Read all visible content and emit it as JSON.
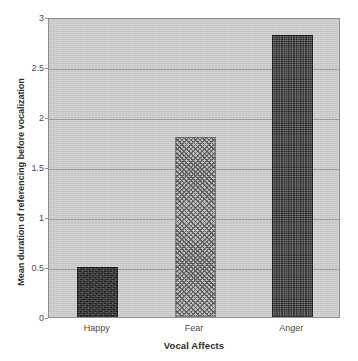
{
  "chart_data": {
    "type": "bar",
    "title": "",
    "categories": [
      "Happy",
      "Fear",
      "Anger"
    ],
    "values": [
      0.5,
      1.8,
      2.82
    ],
    "series": [
      {
        "name": "Mean duration of referencing before vocalization",
        "values": [
          0.5,
          1.8,
          2.82
        ]
      }
    ],
    "xlabel": "Vocal Affects",
    "ylabel": "Mean duration of referencing before vocalization",
    "ylim": [
      0,
      3
    ],
    "yticks": [
      "0",
      "0.5",
      "1",
      "1.5",
      "2",
      "2.5",
      "3"
    ],
    "ytick_values": [
      0,
      0.5,
      1,
      1.5,
      2,
      2.5,
      3
    ],
    "grid": true,
    "grid_axis": "y",
    "legend": "none",
    "bar_styles": [
      "solid-dark",
      "diagonal-hatch",
      "dotted-dark"
    ],
    "plot_background": "#c9c9c9",
    "page_background": "#ffffff",
    "axis_color": "#8e8e8e",
    "gridline_color": "#9a9a9a",
    "bar_colors": [
      "#1d1d1d",
      "#b9b9b9",
      "#232323"
    ]
  }
}
